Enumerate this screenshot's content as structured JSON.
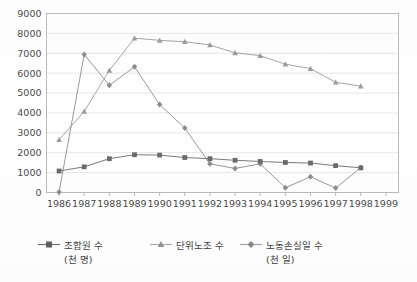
{
  "chart_data": {
    "type": "line",
    "title": "",
    "subtitle": "",
    "xlabel": "",
    "ylabel": "",
    "xlim": [
      1986,
      1999
    ],
    "ylim": [
      0,
      9000
    ],
    "ytick_step": 1000,
    "grid": true,
    "grid_axis": "y",
    "legend_position": "bottom",
    "x": [
      1986,
      1987,
      1988,
      1989,
      1990,
      1991,
      1992,
      1993,
      1994,
      1995,
      1996,
      1997,
      1998
    ],
    "xtick_labels": [
      "1986",
      "1987",
      "1988",
      "1989",
      "1990",
      "1991",
      "1992",
      "1993",
      "1994",
      "1995",
      "1996",
      "1997",
      "1998",
      "1999"
    ],
    "ytick_labels": [
      "0",
      "1000",
      "2000",
      "3000",
      "4000",
      "5000",
      "6000",
      "7000",
      "8000",
      "9000"
    ],
    "series": [
      {
        "name": "조합원 수",
        "unit": "(천 명)",
        "marker": "square",
        "color": "#6b6b6b",
        "values": [
          1080,
          1290,
          1700,
          1900,
          1880,
          1760,
          1700,
          1620,
          1560,
          1510,
          1480,
          1350,
          1240
        ]
      },
      {
        "name": "단위노조 수",
        "unit": "",
        "marker": "triangle",
        "color": "#9a9a9a",
        "values": [
          2650,
          4080,
          6140,
          7760,
          7650,
          7580,
          7420,
          7020,
          6880,
          6450,
          6230,
          5540,
          5350
        ]
      },
      {
        "name": "노동손실일 수",
        "unit": "(천 일)",
        "marker": "diamond",
        "color": "#8c8c8c",
        "values": [
          20,
          6940,
          5390,
          6320,
          4420,
          3240,
          1440,
          1210,
          1440,
          240,
          790,
          220,
          1250
        ]
      }
    ]
  },
  "legend": {
    "entries": [
      {
        "label": "조합원 수",
        "sub": "(천 명)"
      },
      {
        "label": "단위노조 수",
        "sub": ""
      },
      {
        "label": "노동손실일 수",
        "sub": "(천 일)"
      }
    ]
  }
}
